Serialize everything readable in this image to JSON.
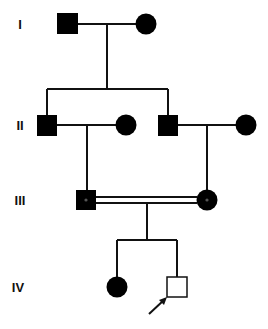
{
  "figure": {
    "type": "pedigree",
    "colors": {
      "affected": "#000000",
      "unaffected": "#ffffff",
      "line": "#111111",
      "carrier_dot": "#555555"
    },
    "generations": [
      {
        "label": "I"
      },
      {
        "label": "II"
      },
      {
        "label": "III"
      },
      {
        "label": "IV"
      }
    ],
    "individuals": [
      {
        "id": "I-1",
        "sex": "male",
        "status": "affected"
      },
      {
        "id": "I-2",
        "sex": "female",
        "status": "affected"
      },
      {
        "id": "II-1",
        "sex": "male",
        "status": "affected"
      },
      {
        "id": "II-2",
        "sex": "female",
        "status": "affected"
      },
      {
        "id": "II-3",
        "sex": "male",
        "status": "affected"
      },
      {
        "id": "II-4",
        "sex": "female",
        "status": "affected"
      },
      {
        "id": "III-1",
        "sex": "male",
        "status": "affected",
        "marker": "center-dot"
      },
      {
        "id": "III-2",
        "sex": "female",
        "status": "affected",
        "marker": "center-dot"
      },
      {
        "id": "IV-1",
        "sex": "female",
        "status": "affected"
      },
      {
        "id": "IV-2",
        "sex": "male",
        "status": "unaffected",
        "proband": true
      }
    ],
    "relationships": [
      {
        "type": "mating",
        "partners": [
          "I-1",
          "I-2"
        ],
        "children": [
          "II-1",
          "II-3"
        ]
      },
      {
        "type": "mating",
        "partners": [
          "II-1",
          "II-2"
        ],
        "children": [
          "III-1"
        ]
      },
      {
        "type": "mating",
        "partners": [
          "II-3",
          "II-4"
        ],
        "children": [
          "III-2"
        ]
      },
      {
        "type": "consanguineous",
        "partners": [
          "III-1",
          "III-2"
        ],
        "children": [
          "IV-1",
          "IV-2"
        ]
      }
    ],
    "proband_arrow": "IV-2"
  }
}
